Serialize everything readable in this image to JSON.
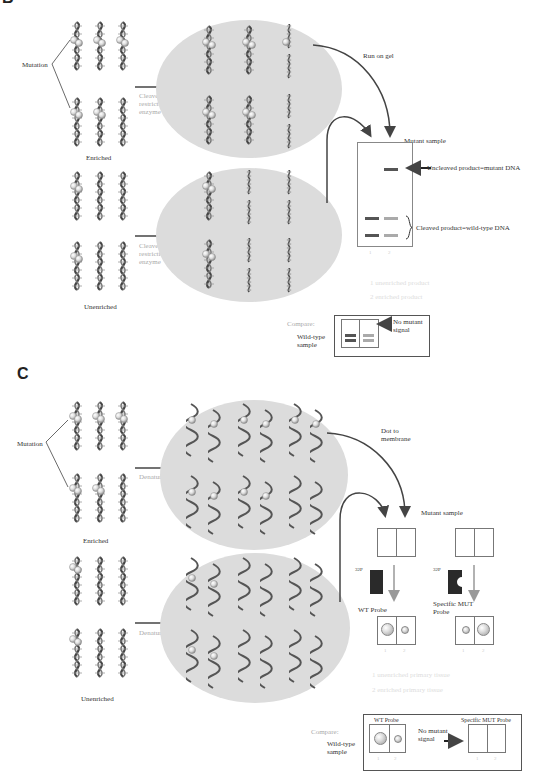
{
  "panels": {
    "B": {
      "letter": "B",
      "labels": {
        "mutation": "Mutation",
        "enriched": "Enriched",
        "unenriched": "Unenriched",
        "step_enriched": "Cleave with restriction enzyme",
        "step_unenriched": "Cleave with restriction enzyme",
        "run_on_gel": "Run on gel",
        "mutant_sample": "Mutant sample",
        "uncleaved": "Uncleaved product=mutant DNA",
        "cleaved": "Cleaved product=wild-type DNA",
        "lane1": "1",
        "lane2": "2",
        "legend1": "1  unenriched product",
        "legend2": "2  enriched product"
      },
      "compare": {
        "title": "Compare:",
        "sample": "Wild-type sample",
        "note": "No mutant signal",
        "lane1": "1",
        "lane2": "2"
      },
      "gel_bands": {
        "lane1": [
          "cleaved-upper",
          "cleaved-lower"
        ],
        "lane2": [
          "uncleaved",
          "cleaved-upper-faint",
          "cleaved-lower-faint"
        ]
      }
    },
    "C": {
      "letter": "C",
      "labels": {
        "mutation": "Mutation",
        "enriched": "Enriched",
        "unenriched": "Unenriched",
        "step_enriched": "Denature",
        "step_unenriched": "Denature",
        "dot_to_membrane": "Dot to membrane",
        "mutant_sample": "Mutant sample",
        "probe_label_left": "32P",
        "probe_label_right": "32P",
        "wt_probe": "WT Probe",
        "mut_probe": "Specific MUT Probe",
        "lane1": "1",
        "lane2": "2",
        "legend1": "1  unenriched primary tissue",
        "legend2": "2  enriched primary tissue"
      },
      "compare": {
        "title": "Compare:",
        "sample": "Wild-type sample",
        "wt_probe": "WT Probe",
        "mut_probe": "Specific MUT Probe",
        "note": "No mutant signal",
        "lane1": "1",
        "lane2": "2"
      },
      "dot_results": {
        "wt_probe": {
          "lane1": "large",
          "lane2": "small"
        },
        "mut_probe": {
          "lane1": "small",
          "lane2": "large"
        },
        "compare_wt": {
          "lane1": "large",
          "lane2": "small"
        },
        "compare_mut": {
          "lane1": "none",
          "lane2": "none"
        }
      }
    }
  },
  "colors": {
    "ellipse": "#dcdcdc",
    "arrow": "#444444",
    "band_dark": "#555555",
    "band_light": "#aaaaaa",
    "probe_gray": "#999999"
  }
}
